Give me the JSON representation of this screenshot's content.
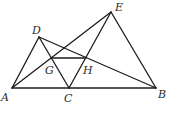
{
  "diagram": {
    "points": {
      "A": {
        "label": "A",
        "x": 12,
        "y": 88,
        "lx": 1,
        "ly": 101
      },
      "B": {
        "label": "B",
        "x": 156,
        "y": 88,
        "lx": 158,
        "ly": 98
      },
      "C": {
        "label": "C",
        "x": 69,
        "y": 88,
        "lx": 64,
        "ly": 102
      },
      "D": {
        "label": "D",
        "x": 39,
        "y": 37,
        "lx": 32,
        "ly": 34
      },
      "E": {
        "label": "E",
        "x": 111,
        "y": 12,
        "lx": 115,
        "ly": 11
      },
      "G": {
        "label": "G",
        "x": 52,
        "y": 58,
        "lx": 45,
        "ly": 74
      },
      "H": {
        "label": "H",
        "x": 86,
        "y": 58,
        "lx": 83,
        "ly": 74
      }
    },
    "segments": [
      [
        "A",
        "B"
      ],
      [
        "A",
        "D"
      ],
      [
        "D",
        "C"
      ],
      [
        "A",
        "E"
      ],
      [
        "E",
        "C"
      ],
      [
        "E",
        "B"
      ],
      [
        "D",
        "B"
      ],
      [
        "G",
        "H"
      ]
    ]
  }
}
